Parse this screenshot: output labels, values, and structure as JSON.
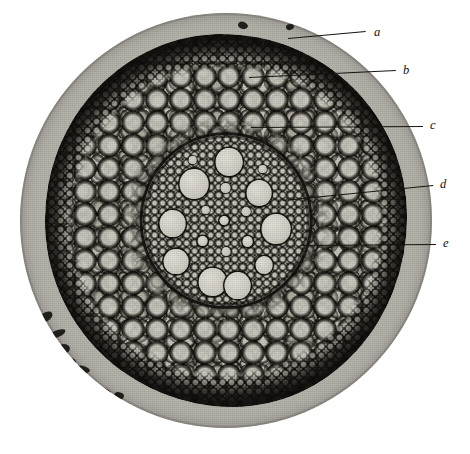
{
  "figure": {
    "kind": "photomicrograph",
    "background_color": "#ffffff",
    "field": {
      "shape": "circle",
      "center_x": 226,
      "center_y": 220,
      "radius": 206,
      "mount_color": "#b9b6ae",
      "tissue_color": "#9e9a92",
      "outline_color": "#15140f"
    }
  },
  "labels": [
    {
      "id": "a",
      "text": "a",
      "x": 374,
      "y": 26,
      "leader": {
        "x1": 288,
        "y1": 38,
        "x2": 366,
        "y2": 31
      }
    },
    {
      "id": "b",
      "text": "b",
      "x": 403,
      "y": 64,
      "leader": {
        "x1": 249,
        "y1": 77,
        "x2": 396,
        "y2": 70
      }
    },
    {
      "id": "c",
      "text": "c",
      "x": 430,
      "y": 119,
      "leader": {
        "x1": 251,
        "y1": 127,
        "x2": 423,
        "y2": 126
      }
    },
    {
      "id": "d",
      "text": "d",
      "x": 440,
      "y": 178,
      "leader": {
        "x1": 283,
        "y1": 200,
        "x2": 433,
        "y2": 185
      }
    },
    {
      "id": "e",
      "text": "e",
      "x": 443,
      "y": 237,
      "leader": {
        "x1": 301,
        "y1": 245,
        "x2": 436,
        "y2": 244
      }
    }
  ],
  "vessels": [
    {
      "cx": 52,
      "cy": 16,
      "r": 8.0
    },
    {
      "cx": 31,
      "cy": 29,
      "r": 8.8
    },
    {
      "cx": 70,
      "cy": 34,
      "r": 7.6
    },
    {
      "cx": 18,
      "cy": 52,
      "r": 7.8
    },
    {
      "cx": 80,
      "cy": 55,
      "r": 8.6
    },
    {
      "cx": 20,
      "cy": 74,
      "r": 7.4
    },
    {
      "cx": 73,
      "cy": 76,
      "r": 5.2
    },
    {
      "cx": 42,
      "cy": 86,
      "r": 8.2
    },
    {
      "cx": 57,
      "cy": 88,
      "r": 8.0
    },
    {
      "cx": 63,
      "cy": 62,
      "r": 3.2
    },
    {
      "cx": 36,
      "cy": 62,
      "r": 3.0
    },
    {
      "cx": 49,
      "cy": 50,
      "r": 2.6
    }
  ],
  "pith_cells": [
    {
      "cx": 50,
      "cy": 31,
      "r": 3.0
    },
    {
      "cx": 62,
      "cy": 45,
      "r": 2.6
    },
    {
      "cx": 38,
      "cy": 44,
      "r": 2.4
    },
    {
      "cx": 50,
      "cy": 68,
      "r": 2.8
    },
    {
      "cx": 30,
      "cy": 15,
      "r": 2.2
    },
    {
      "cx": 72,
      "cy": 20,
      "r": 2.2
    }
  ],
  "artifacts": [
    {
      "x": 40,
      "y": 312,
      "w": 13,
      "h": 9,
      "rot": -28
    },
    {
      "x": 50,
      "y": 330,
      "w": 16,
      "h": 7,
      "rot": -22
    },
    {
      "x": 58,
      "y": 344,
      "w": 12,
      "h": 10,
      "rot": -10
    },
    {
      "x": 66,
      "y": 358,
      "w": 10,
      "h": 8,
      "rot": 8
    },
    {
      "x": 76,
      "y": 366,
      "w": 14,
      "h": 7,
      "rot": 14
    },
    {
      "x": 62,
      "y": 376,
      "w": 9,
      "h": 6,
      "rot": 0
    },
    {
      "x": 84,
      "y": 380,
      "w": 11,
      "h": 9,
      "rot": 20
    },
    {
      "x": 96,
      "y": 388,
      "w": 15,
      "h": 8,
      "rot": 12
    },
    {
      "x": 114,
      "y": 392,
      "w": 10,
      "h": 8,
      "rot": 4
    },
    {
      "x": 238,
      "y": 22,
      "w": 10,
      "h": 7,
      "rot": 16
    },
    {
      "x": 286,
      "y": 24,
      "w": 8,
      "h": 6,
      "rot": -12
    }
  ]
}
